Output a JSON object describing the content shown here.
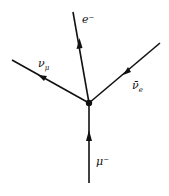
{
  "diagram": {
    "vertex": {
      "x": 89,
      "y": 103
    },
    "lines": [
      {
        "id": "electron",
        "label": "e⁻",
        "from": [
          89,
          103
        ],
        "to": [
          73,
          12
        ]
      },
      {
        "id": "muon-neutrino",
        "label": "νμ",
        "from": [
          89,
          103
        ],
        "to": [
          12,
          60
        ]
      },
      {
        "id": "electron-antineutrino",
        "label": "ν̄e",
        "from": [
          160,
          43
        ],
        "to": [
          89,
          103
        ]
      },
      {
        "id": "muon",
        "label": "μ⁻",
        "from": [
          89,
          183
        ],
        "to": [
          89,
          103
        ]
      }
    ],
    "labels": {
      "electron": "e⁻",
      "muon_neutrino_base": "ν",
      "muon_neutrino_sub": "μ",
      "electron_antineutrino_base": "ν̄",
      "electron_antineutrino_sub": "e",
      "muon": "μ⁻"
    },
    "color": "#111111"
  }
}
